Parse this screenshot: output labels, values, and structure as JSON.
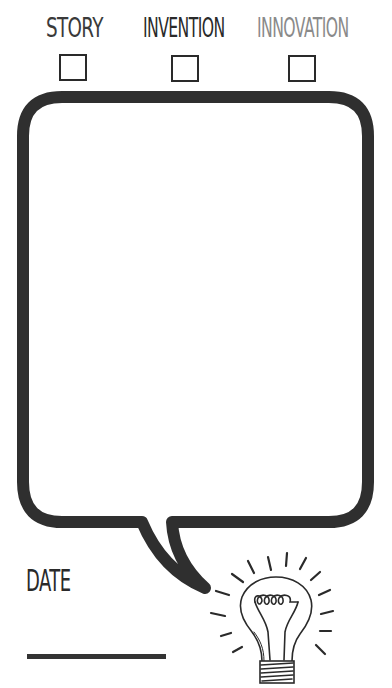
{
  "categories": [
    {
      "label": "STORY",
      "checked": false,
      "color": "#3a3a3a"
    },
    {
      "label": "INVENTION",
      "checked": false,
      "color": "#2a2a2a"
    },
    {
      "label": "INNOVATION",
      "checked": false,
      "color": "#8a8a8a"
    }
  ],
  "bubble": {
    "content": "",
    "stroke_color": "#2f2f2f"
  },
  "date": {
    "label": "DATE",
    "value": ""
  },
  "icon": {
    "name": "lightbulb-icon"
  }
}
